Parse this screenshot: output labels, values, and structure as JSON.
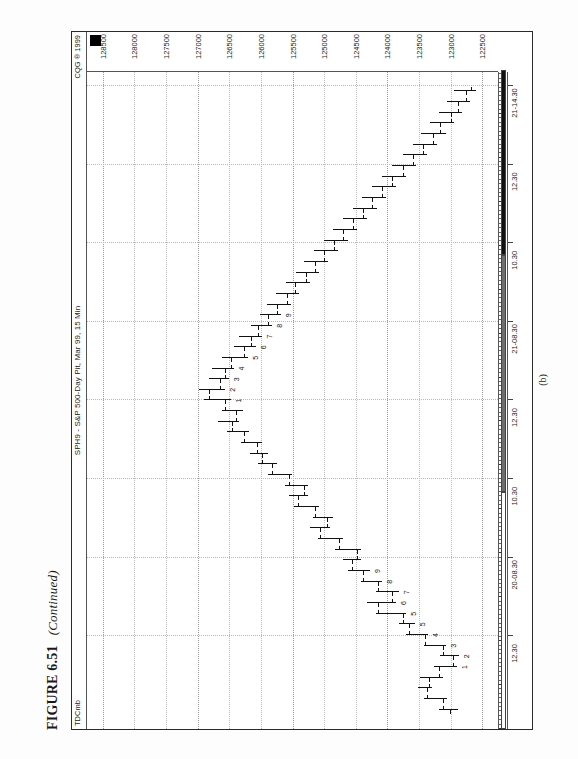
{
  "figure": {
    "label": "FIGURE 6.51",
    "continued": "(Continued)",
    "subcaption": "(b)"
  },
  "chart_header": {
    "left_tag": "TDCmb",
    "title": "SPH9 - S&P 500-Day Pit, Mar 99, 15 Min",
    "source": "CQG ® 1999"
  },
  "markers": {
    "cursor_square": "black-square-marker"
  },
  "chart_data": {
    "type": "bar",
    "chart_kind": "ohlc-bar-chart",
    "title": "SPH9 - S&P 500-Day Pit, Mar 99, 15 Min",
    "xlabel": "",
    "ylabel": "",
    "grid": true,
    "legend": "none",
    "ylim": [
      122250,
      128750
    ],
    "ytick_step": 500,
    "ytick_labels": [
      "128500",
      "128000",
      "127500",
      "127000",
      "126500",
      "126000",
      "125500",
      "125000",
      "124500",
      "124000",
      "123500",
      "123000",
      "122500"
    ],
    "ytick_values": [
      128500,
      128000,
      127500,
      127000,
      126500,
      126000,
      125500,
      125000,
      124500,
      124000,
      123500,
      123000,
      122500
    ],
    "xtick_labels": [
      "12.30",
      "20-08.30",
      "10.30",
      "12.30",
      "21-08.30",
      "10.30",
      "12.30",
      "21-14.30"
    ],
    "session_dividers": [
      "20-08.30",
      "21-08.30"
    ],
    "annotations": [
      {
        "text": "1"
      },
      {
        "text": "2"
      },
      {
        "text": "3"
      },
      {
        "text": "4"
      },
      {
        "text": "5"
      },
      {
        "text": "6"
      },
      {
        "text": "7"
      },
      {
        "text": "8"
      },
      {
        "text": "9"
      },
      {
        "text": "10"
      },
      {
        "text": "11"
      },
      {
        "text": "12"
      },
      {
        "text": "13"
      },
      {
        "text": "1"
      },
      {
        "text": "2"
      },
      {
        "text": "3"
      },
      {
        "text": "4"
      },
      {
        "text": "5"
      },
      {
        "text": "6"
      },
      {
        "text": "7"
      },
      {
        "text": "8"
      },
      {
        "text": "9"
      },
      {
        "text": "1"
      },
      {
        "text": "2"
      },
      {
        "text": "3"
      },
      {
        "text": "4"
      },
      {
        "text": "5"
      },
      {
        "text": "6"
      },
      {
        "text": "7"
      },
      {
        "text": "8"
      },
      {
        "text": "9"
      }
    ],
    "bars": [
      {
        "i": 0,
        "o": 123010,
        "h": 123180,
        "l": 122880,
        "c": 123120
      },
      {
        "i": 1,
        "o": 123120,
        "h": 123420,
        "l": 123060,
        "c": 123380
      },
      {
        "i": 2,
        "o": 123380,
        "h": 123520,
        "l": 123300,
        "c": 123340
      },
      {
        "i": 3,
        "o": 123340,
        "h": 123480,
        "l": 123120,
        "c": 123180
      },
      {
        "i": 4,
        "o": 123180,
        "h": 123260,
        "l": 122900,
        "c": 122960,
        "label": "1"
      },
      {
        "i": 5,
        "o": 122960,
        "h": 123160,
        "l": 122860,
        "c": 123120,
        "label": "2"
      },
      {
        "i": 6,
        "o": 123120,
        "h": 123420,
        "l": 123080,
        "c": 123400,
        "label": "3"
      },
      {
        "i": 7,
        "o": 123400,
        "h": 123700,
        "l": 123360,
        "c": 123660,
        "label": "4"
      },
      {
        "i": 8,
        "o": 123660,
        "h": 123820,
        "l": 123560,
        "c": 123760,
        "label": "5"
      },
      {
        "i": 9,
        "o": 123760,
        "h": 124180,
        "l": 123700,
        "c": 124140,
        "label": "5"
      },
      {
        "i": 10,
        "o": 124140,
        "h": 124320,
        "l": 123860,
        "c": 123920,
        "label": "6"
      },
      {
        "i": 11,
        "o": 123920,
        "h": 124180,
        "l": 123820,
        "c": 124140,
        "label": "7"
      },
      {
        "i": 12,
        "o": 124140,
        "h": 124420,
        "l": 124080,
        "c": 124380,
        "label": "8"
      },
      {
        "i": 13,
        "o": 124380,
        "h": 124620,
        "l": 124280,
        "c": 124560,
        "label": "9"
      },
      {
        "i": 14,
        "o": 124560,
        "h": 124700,
        "l": 124420,
        "c": 124480
      },
      {
        "i": 15,
        "o": 124480,
        "h": 124820,
        "l": 124420,
        "c": 124760
      },
      {
        "i": 16,
        "o": 124760,
        "h": 125100,
        "l": 124700,
        "c": 125060
      },
      {
        "i": 17,
        "o": 125060,
        "h": 125220,
        "l": 124900,
        "c": 124960
      },
      {
        "i": 18,
        "o": 124960,
        "h": 125180,
        "l": 124860,
        "c": 125140
      },
      {
        "i": 19,
        "o": 125140,
        "h": 125480,
        "l": 125080,
        "c": 125420
      },
      {
        "i": 20,
        "o": 125420,
        "h": 125560,
        "l": 125260,
        "c": 125320
      },
      {
        "i": 21,
        "o": 125320,
        "h": 125620,
        "l": 125260,
        "c": 125560
      },
      {
        "i": 22,
        "o": 125560,
        "h": 125880,
        "l": 125500,
        "c": 125820
      },
      {
        "i": 23,
        "o": 125820,
        "h": 126040,
        "l": 125740,
        "c": 125980
      },
      {
        "i": 24,
        "o": 125980,
        "h": 126180,
        "l": 125880,
        "c": 126060
      },
      {
        "i": 25,
        "o": 126060,
        "h": 126320,
        "l": 125980,
        "c": 126260
      },
      {
        "i": 26,
        "o": 126260,
        "h": 126540,
        "l": 126180,
        "c": 126460
      },
      {
        "i": 27,
        "o": 126460,
        "h": 126680,
        "l": 126340,
        "c": 126400
      },
      {
        "i": 28,
        "o": 126400,
        "h": 126620,
        "l": 126280,
        "c": 126560
      },
      {
        "i": 29,
        "o": 126560,
        "h": 126900,
        "l": 126480,
        "c": 126820,
        "label": "1"
      },
      {
        "i": 30,
        "o": 126820,
        "h": 126980,
        "l": 126560,
        "c": 126640,
        "label": "2"
      },
      {
        "i": 31,
        "o": 126640,
        "h": 126820,
        "l": 126500,
        "c": 126560,
        "label": "3"
      },
      {
        "i": 32,
        "o": 126560,
        "h": 126780,
        "l": 126420,
        "c": 126480,
        "label": "4"
      },
      {
        "i": 33,
        "o": 126480,
        "h": 126620,
        "l": 126200,
        "c": 126260,
        "label": "5"
      },
      {
        "i": 34,
        "o": 126260,
        "h": 126420,
        "l": 126080,
        "c": 126160,
        "label": "6"
      },
      {
        "i": 35,
        "o": 126160,
        "h": 126340,
        "l": 125980,
        "c": 126040,
        "label": "7"
      },
      {
        "i": 36,
        "o": 126040,
        "h": 126160,
        "l": 125820,
        "c": 125880,
        "label": "8"
      },
      {
        "i": 37,
        "o": 125880,
        "h": 126020,
        "l": 125680,
        "c": 125740,
        "label": "9"
      },
      {
        "i": 38,
        "o": 125740,
        "h": 125900,
        "l": 125520,
        "c": 125580
      },
      {
        "i": 39,
        "o": 125580,
        "h": 125760,
        "l": 125400,
        "c": 125460
      },
      {
        "i": 40,
        "o": 125460,
        "h": 125600,
        "l": 125220,
        "c": 125280
      },
      {
        "i": 41,
        "o": 125280,
        "h": 125440,
        "l": 125080,
        "c": 125140
      },
      {
        "i": 42,
        "o": 125140,
        "h": 125320,
        "l": 124940,
        "c": 125000
      },
      {
        "i": 43,
        "o": 125000,
        "h": 125160,
        "l": 124780,
        "c": 124840
      },
      {
        "i": 44,
        "o": 124840,
        "h": 125000,
        "l": 124620,
        "c": 124700
      },
      {
        "i": 45,
        "o": 124700,
        "h": 124860,
        "l": 124480,
        "c": 124540
      },
      {
        "i": 46,
        "o": 124540,
        "h": 124700,
        "l": 124320,
        "c": 124380
      },
      {
        "i": 47,
        "o": 124380,
        "h": 124540,
        "l": 124160,
        "c": 124240
      },
      {
        "i": 48,
        "o": 124240,
        "h": 124400,
        "l": 124020,
        "c": 124080
      },
      {
        "i": 49,
        "o": 124080,
        "h": 124240,
        "l": 123860,
        "c": 123920
      },
      {
        "i": 50,
        "o": 123920,
        "h": 124080,
        "l": 123700,
        "c": 123760
      },
      {
        "i": 51,
        "o": 123760,
        "h": 123920,
        "l": 123540,
        "c": 123600
      },
      {
        "i": 52,
        "o": 123600,
        "h": 123760,
        "l": 123380,
        "c": 123440
      },
      {
        "i": 53,
        "o": 123440,
        "h": 123600,
        "l": 123220,
        "c": 123280
      },
      {
        "i": 54,
        "o": 123280,
        "h": 123460,
        "l": 123080,
        "c": 123160
      },
      {
        "i": 55,
        "o": 123160,
        "h": 123320,
        "l": 122940,
        "c": 123000
      },
      {
        "i": 56,
        "o": 123000,
        "h": 123180,
        "l": 122820,
        "c": 122880
      },
      {
        "i": 57,
        "o": 122880,
        "h": 123060,
        "l": 122700,
        "c": 122760
      },
      {
        "i": 58,
        "o": 122760,
        "h": 122940,
        "l": 122600,
        "c": 122680
      }
    ]
  }
}
